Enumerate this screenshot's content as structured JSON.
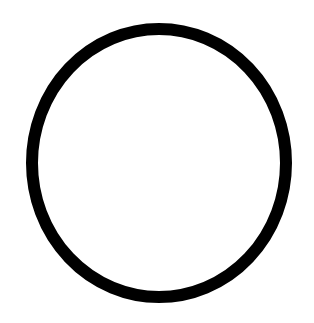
{
  "document": {
    "title": "Circle Outline",
    "kind": "line-drawing",
    "width": 314,
    "height": 323,
    "background_color": "#ffffff",
    "text_content": "",
    "notes": "Single unfilled black circular ring centered on a plain white field; no text, labels, or interface chrome present."
  },
  "figure": {
    "name": "circle-outline",
    "shape": "circle",
    "fill": "none",
    "stroke_color": "#000000",
    "stroke_width": 12,
    "stroke_width_top_bottom": 13,
    "center_x": 159,
    "center_y": 163,
    "radius_x": 133,
    "radius_y": 140,
    "bounds": {
      "left": 20,
      "top": 17,
      "right": 299,
      "bottom": 310,
      "width": 279,
      "height": 293
    }
  }
}
